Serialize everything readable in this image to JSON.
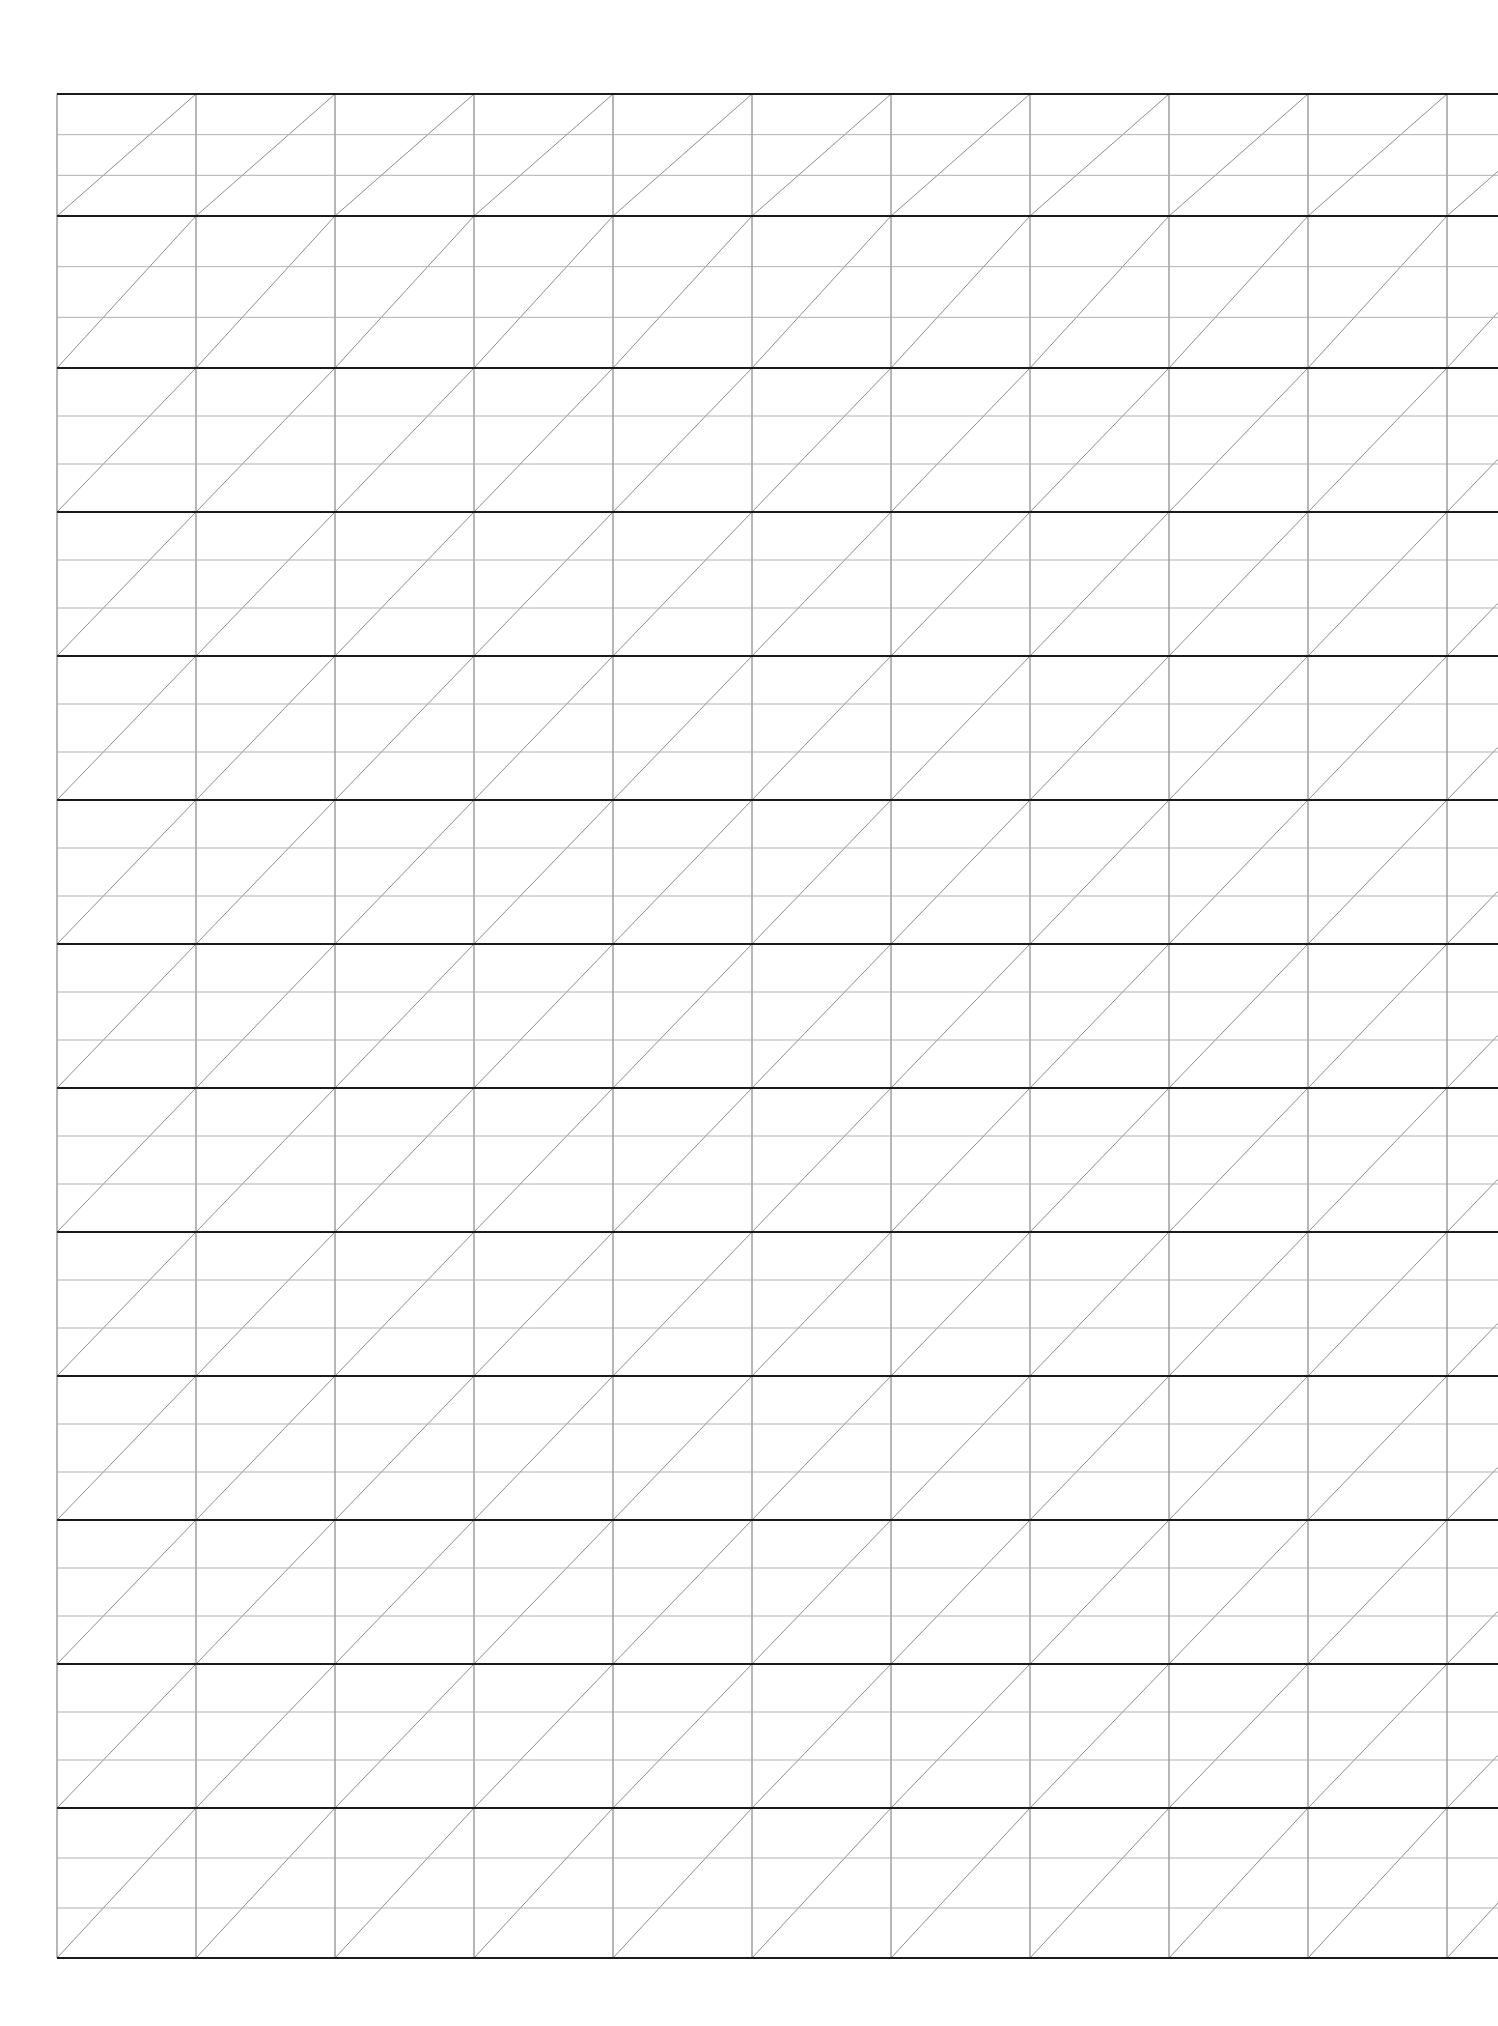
{
  "page": {
    "width": 1498,
    "height": 2026,
    "background_color": "#ffffff"
  },
  "grid": {
    "description": "Hand-ruled style grid: heavy horizontal rules bounding bands, each band split by two light horizontal rules, light vertical rules, and one light diagonal per major cell running from lower-left to upper-right.",
    "origin_x": 57,
    "origin_y": 94,
    "right_x": 1498,
    "bottom_y": 1958,
    "column_width": 139,
    "column_count": 11,
    "vertical_lines_x": [
      57,
      196,
      335,
      474,
      613,
      752,
      891,
      1030,
      1169,
      1308,
      1447
    ],
    "major_row_height": 155.3,
    "major_row_count": 12,
    "major_lines_y": [
      94,
      216,
      368,
      512,
      656,
      800,
      944,
      1088,
      1232,
      1376,
      1520,
      1664,
      1808,
      1958
    ],
    "minor_rows_per_major": 3,
    "diagonal_direction": "lower-left-to-upper-right",
    "diagonal_per_major_cell": 1,
    "colors": {
      "major_line": "#1a1a1a",
      "minor_line": "#a8a8a8",
      "vertical_line": "#6e6e6e",
      "diagonal_line": "#8c8c8c",
      "paper": "#ffffff"
    },
    "stroke_widths": {
      "major_line": 2.2,
      "minor_line": 0.9,
      "vertical_line": 1.0,
      "diagonal_line": 1.0
    }
  }
}
